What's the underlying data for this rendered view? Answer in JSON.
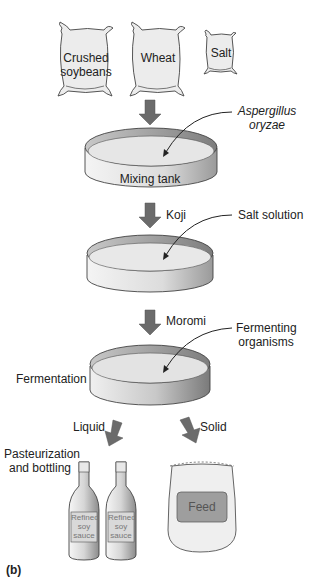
{
  "diagram": {
    "panel_label": "(b)",
    "ingredients": [
      {
        "label_line1": "Crushed",
        "label_line2": "soybeans"
      },
      {
        "label_line1": "Wheat",
        "label_line2": ""
      },
      {
        "label_line1": "Salt",
        "label_line2": ""
      }
    ],
    "stages": {
      "mixing_tank": {
        "label": "Mixing tank",
        "input_line1": "Aspergillus",
        "input_line2": "oryzae"
      },
      "koji": {
        "flow_label": "Koji",
        "input": "Salt solution"
      },
      "moromi": {
        "flow_label": "Moromi",
        "input_line1": "Fermenting",
        "input_line2": "organisms",
        "stage_label": "Fermentation"
      }
    },
    "outputs": {
      "liquid": {
        "flow_label": "Liquid",
        "process_line1": "Pasteurization",
        "process_line2": "and bottling",
        "bottle_label_line1": "Refined",
        "bottle_label_line2": "soy",
        "bottle_label_line3": "sauce"
      },
      "solid": {
        "flow_label": "Solid",
        "bag_label": "Feed"
      }
    },
    "colors": {
      "arrow": "#6b6b6b",
      "outline": "#444444",
      "bag_fill": "#ececec",
      "tank_surface": "#e6e6e6",
      "tank_rim": "#9a9a9a",
      "feed_label": "#9e9e9e"
    }
  }
}
